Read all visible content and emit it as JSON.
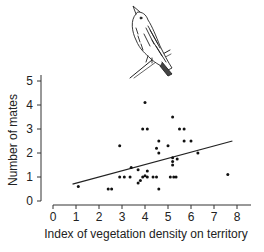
{
  "chart_data": {
    "type": "scatter",
    "title": "",
    "xlabel": "Index of vegetation density on territory",
    "ylabel": "Number of mates",
    "xlim": [
      0,
      8
    ],
    "ylim": [
      0,
      5
    ],
    "x_ticks": [
      "0",
      "1",
      "2",
      "3",
      "4",
      "5",
      "6",
      "7",
      "8"
    ],
    "y_ticks": [
      "0",
      "1",
      "2",
      "3",
      "4",
      "5"
    ],
    "grid": false,
    "legend": null,
    "illustration": "bird-perched-on-branch",
    "series": [
      {
        "name": "territories",
        "points": [
          {
            "x": 1.1,
            "y": 0.6
          },
          {
            "x": 2.4,
            "y": 0.5
          },
          {
            "x": 2.55,
            "y": 0.5
          },
          {
            "x": 2.9,
            "y": 2.3
          },
          {
            "x": 2.9,
            "y": 1.0
          },
          {
            "x": 3.1,
            "y": 1.0
          },
          {
            "x": 3.35,
            "y": 1.0
          },
          {
            "x": 3.4,
            "y": 1.4
          },
          {
            "x": 3.7,
            "y": 1.3
          },
          {
            "x": 3.7,
            "y": 0.75
          },
          {
            "x": 3.8,
            "y": 0.85
          },
          {
            "x": 3.9,
            "y": 1.0
          },
          {
            "x": 4.0,
            "y": 1.05
          },
          {
            "x": 4.1,
            "y": 1.0
          },
          {
            "x": 4.1,
            "y": 1.25
          },
          {
            "x": 3.9,
            "y": 3.0
          },
          {
            "x": 4.1,
            "y": 3.0
          },
          {
            "x": 4.0,
            "y": 4.1
          },
          {
            "x": 4.35,
            "y": 1.0
          },
          {
            "x": 4.5,
            "y": 1.0
          },
          {
            "x": 4.5,
            "y": 2.2
          },
          {
            "x": 4.6,
            "y": 2.5
          },
          {
            "x": 4.6,
            "y": 2.0
          },
          {
            "x": 4.6,
            "y": 0.5
          },
          {
            "x": 5.0,
            "y": 2.3
          },
          {
            "x": 5.1,
            "y": 1.0
          },
          {
            "x": 5.25,
            "y": 1.0
          },
          {
            "x": 5.35,
            "y": 1.0
          },
          {
            "x": 5.2,
            "y": 1.8
          },
          {
            "x": 5.2,
            "y": 1.65
          },
          {
            "x": 5.2,
            "y": 1.5
          },
          {
            "x": 5.2,
            "y": 3.5
          },
          {
            "x": 5.4,
            "y": 1.75
          },
          {
            "x": 5.5,
            "y": 3.0
          },
          {
            "x": 5.7,
            "y": 3.0
          },
          {
            "x": 5.7,
            "y": 2.5
          },
          {
            "x": 6.0,
            "y": 2.5
          },
          {
            "x": 6.3,
            "y": 2.0
          },
          {
            "x": 7.6,
            "y": 1.1
          }
        ]
      }
    ],
    "regression_line": {
      "x1": 0.85,
      "y1": 0.7,
      "x2": 7.8,
      "y2": 2.5
    }
  }
}
